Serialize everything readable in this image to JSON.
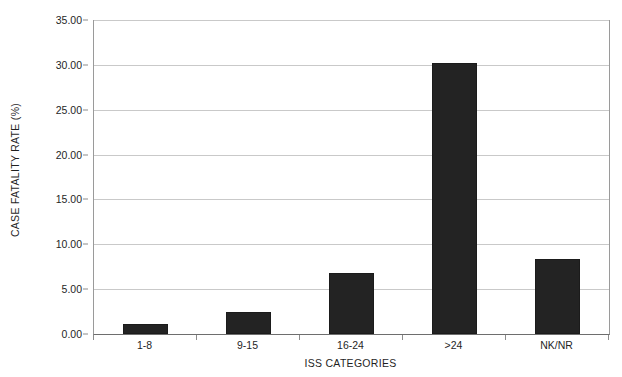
{
  "chart_data": {
    "type": "bar",
    "title": "",
    "xlabel": "ISS CATEGORIES",
    "ylabel": "CASE FATALITY RATE (%)",
    "categories": [
      "1-8",
      "9-15",
      "16-24",
      ">24",
      "NK/NR"
    ],
    "values": [
      1.1,
      2.5,
      6.8,
      30.2,
      8.4
    ],
    "ylim": [
      0,
      35
    ],
    "ytick_labels": [
      "0.00",
      "5.00",
      "10.00",
      "15.00",
      "20.00",
      "25.00",
      "30.00",
      "35.00"
    ],
    "ytick_values": [
      0,
      5,
      10,
      15,
      20,
      25,
      30,
      35
    ],
    "grid": true,
    "legend": "none",
    "bar_color": "#232323",
    "gridline_color": "#c9c9c9",
    "axis_color": "#6e6e6e",
    "background_color": "#ffffff"
  }
}
